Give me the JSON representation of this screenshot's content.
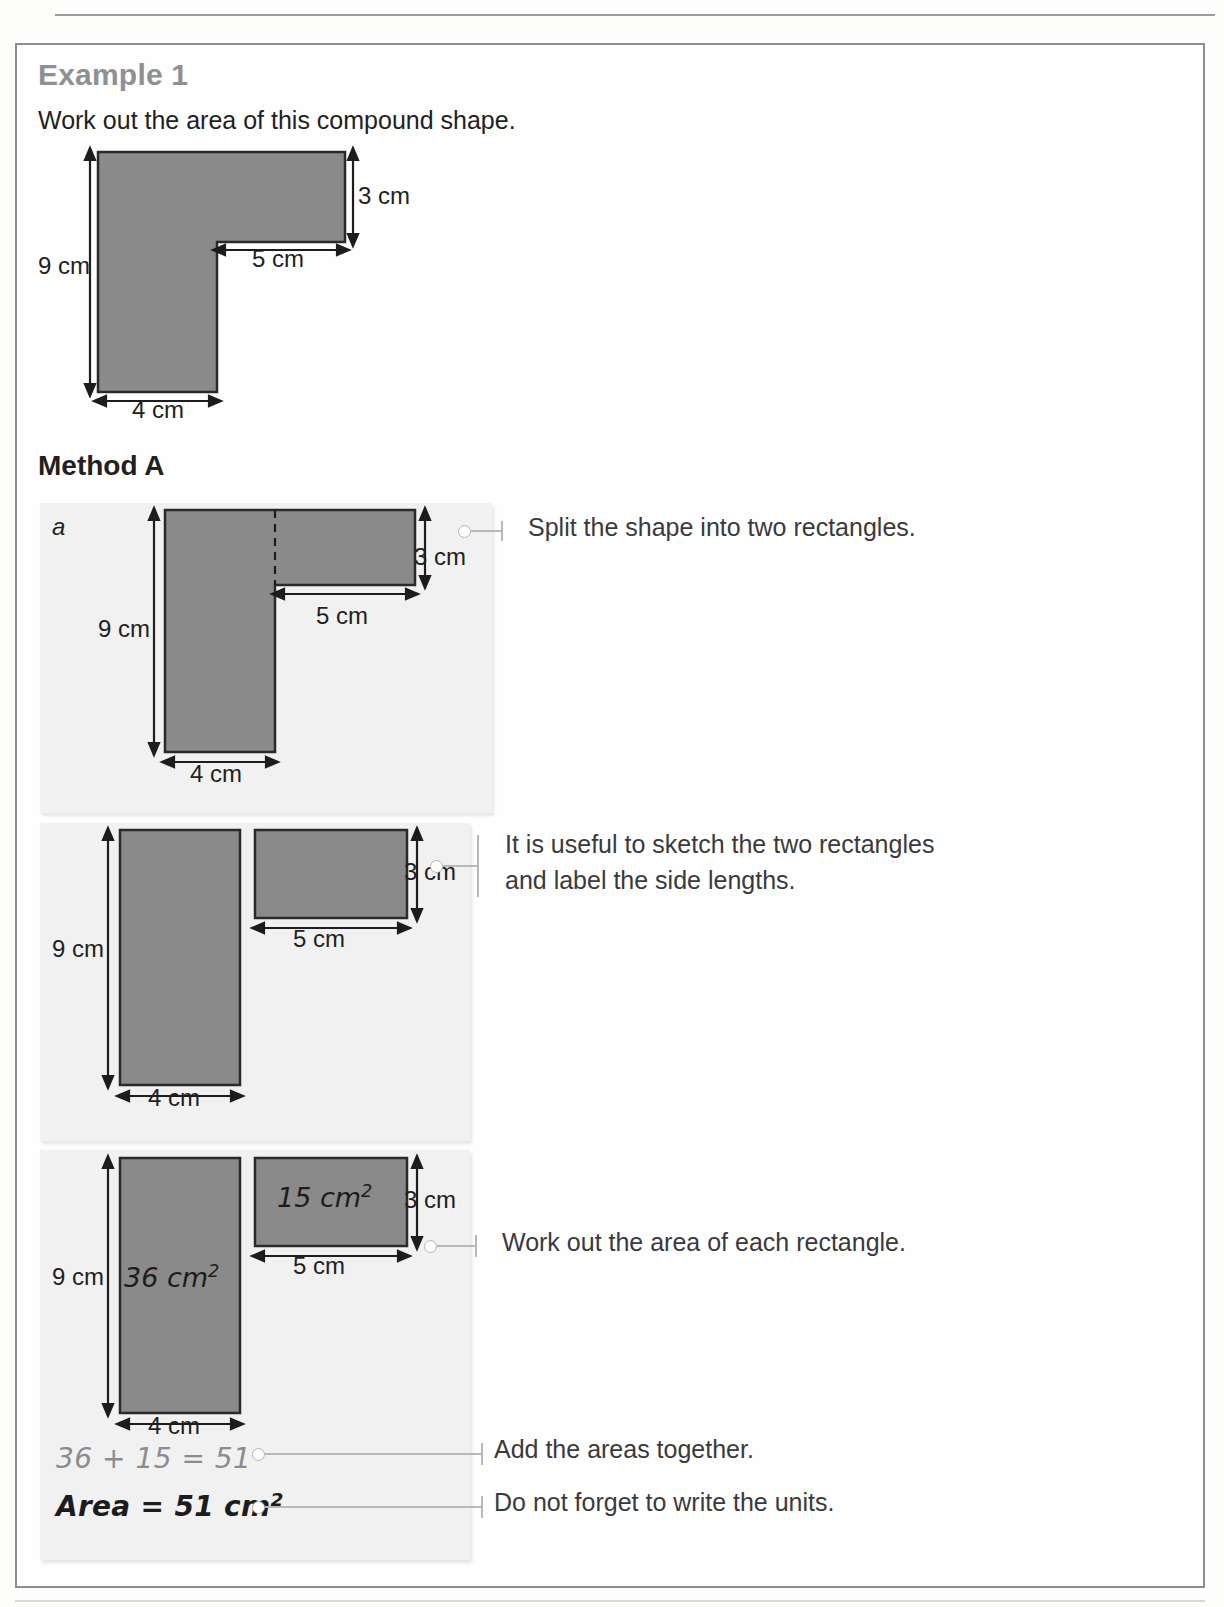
{
  "page": {
    "example_heading": "Example 1",
    "prompt": "Work out the area of this compound shape.",
    "method_heading": "Method A"
  },
  "figure_main": {
    "label_height_total": "9 cm",
    "label_height_top": "3 cm",
    "label_width_top": "5 cm",
    "label_width_bottom": "4 cm"
  },
  "panel_1": {
    "part_label": "a",
    "label_height_total": "9 cm",
    "label_height_top": "3 cm",
    "label_width_top": "5 cm",
    "label_width_bottom": "4 cm",
    "note": "Split the shape into two rectangles."
  },
  "panel_2": {
    "label_height_tall": "9 cm",
    "label_width_tall": "4 cm",
    "label_height_wide": "3 cm",
    "label_width_wide": "5 cm",
    "note": "It is useful to sketch the two rectangles\nand label the side lengths."
  },
  "panel_3": {
    "label_height_tall": "9 cm",
    "label_width_tall": "4 cm",
    "label_height_wide": "3 cm",
    "label_width_wide": "5 cm",
    "area_tall": "36 cm",
    "area_tall_exp": "2",
    "area_wide": "15 cm",
    "area_wide_exp": "2",
    "note": "Work out the area of each rectangle."
  },
  "working": {
    "sum_line": "36 + 15 = 51",
    "result_prefix": "Area = 51 cm",
    "result_exp": "2",
    "note_add": "Add the areas together.",
    "note_units": "Do not forget to write the units."
  },
  "icons": {
    "callout_dot": "callout-dot-icon",
    "callout_tick": "callout-tick-icon",
    "arrow_double_vertical": "double-arrow-vertical-icon",
    "arrow_double_horizontal": "double-arrow-horizontal-icon"
  },
  "colors": {
    "shape_fill": "#8a8a8a",
    "shape_stroke": "#2a2a2a",
    "panel_bg": "#f1f1f1",
    "heading_muted": "#8e9093",
    "text": "#231f20",
    "callout": "#b8b8b8"
  }
}
